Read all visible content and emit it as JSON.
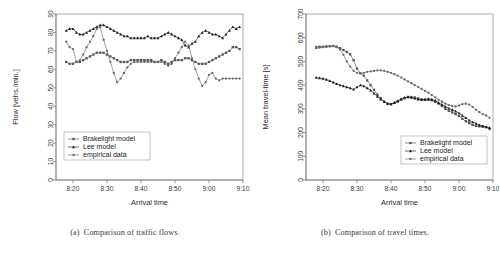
{
  "figure": {
    "panels": [
      {
        "id": "a",
        "caption_id": "(a)",
        "caption_text": "Comparison of traffic flows.",
        "chart_data": {
          "type": "line",
          "title": "",
          "xlabel": "Arrival time",
          "ylabel": "Flow [vehs./min.]",
          "xlim": [
            495,
            550
          ],
          "ylim": [
            0,
            90
          ],
          "yticks": [
            0,
            10,
            20,
            30,
            40,
            50,
            60,
            70,
            80,
            90
          ],
          "xticks": [
            500,
            510,
            520,
            530,
            540,
            550
          ],
          "xticklabels": [
            "8:20",
            "8:30",
            "8:40",
            "8:50",
            "9:00",
            "9:10"
          ],
          "grid": false,
          "legend_position": "lower-left",
          "x": [
            498,
            499,
            500,
            501,
            502,
            503,
            504,
            505,
            506,
            507,
            508,
            509,
            510,
            511,
            512,
            513,
            514,
            515,
            516,
            517,
            518,
            519,
            520,
            521,
            522,
            523,
            524,
            525,
            526,
            527,
            528,
            529,
            530,
            531,
            532,
            533,
            534,
            535,
            536,
            537,
            538,
            539,
            540,
            541,
            542,
            543,
            544,
            545,
            546,
            547,
            548,
            549
          ],
          "series": [
            {
              "name": "Brakelight model",
              "marker": "square",
              "color": "#555555",
              "values": [
                64,
                63,
                63,
                64,
                64,
                65,
                66,
                67,
                68,
                69,
                69,
                69,
                68,
                67,
                66,
                65,
                64,
                64,
                64,
                65,
                65,
                65,
                65,
                65,
                65,
                65,
                64,
                64,
                65,
                64,
                63,
                64,
                65,
                65,
                65,
                66,
                66,
                65,
                64,
                63,
                63,
                63,
                64,
                65,
                66,
                67,
                68,
                69,
                70,
                72,
                72,
                71
              ]
            },
            {
              "name": "Lee model",
              "marker": "triangle",
              "color": "#1a1a1a",
              "values": [
                81,
                82,
                82,
                80,
                79,
                79,
                80,
                81,
                82,
                83,
                84,
                84,
                83,
                82,
                81,
                80,
                79,
                78,
                78,
                77,
                77,
                77,
                77,
                77,
                78,
                77,
                77,
                77,
                78,
                79,
                80,
                79,
                78,
                77,
                76,
                73,
                72,
                74,
                75,
                78,
                80,
                81,
                80,
                79,
                79,
                78,
                77,
                79,
                81,
                83,
                82,
                83
              ]
            },
            {
              "name": "empirical data",
              "marker": "circle",
              "color": "#6a6a6a",
              "values": [
                75,
                72,
                71,
                64,
                65,
                68,
                72,
                75,
                78,
                82,
                83,
                76,
                70,
                64,
                58,
                53,
                55,
                58,
                61,
                63,
                64,
                64,
                64,
                64,
                64,
                64,
                64,
                64,
                64,
                63,
                62,
                63,
                66,
                69,
                72,
                75,
                73,
                66,
                60,
                55,
                51,
                53,
                57,
                58,
                55,
                54,
                55,
                55,
                55,
                55,
                55,
                55
              ]
            }
          ]
        }
      },
      {
        "id": "b",
        "caption_id": "(b)",
        "caption_text": "Comparison of travel times.",
        "chart_data": {
          "type": "line",
          "title": "",
          "xlabel": "Arrival time",
          "ylabel": "Mean travel-time [s]",
          "xlim": [
            495,
            550
          ],
          "ylim": [
            0,
            700
          ],
          "yticks": [
            0,
            100,
            200,
            300,
            400,
            500,
            600,
            700
          ],
          "xticks": [
            500,
            510,
            520,
            530,
            540,
            550
          ],
          "xticklabels": [
            "8:20",
            "8:30",
            "8:40",
            "8:50",
            "9:00",
            "9:10"
          ],
          "grid": false,
          "legend_position": "lower-right",
          "x": [
            498,
            499,
            500,
            501,
            502,
            503,
            504,
            505,
            506,
            507,
            508,
            509,
            510,
            511,
            512,
            513,
            514,
            515,
            516,
            517,
            518,
            519,
            520,
            521,
            522,
            523,
            524,
            525,
            526,
            527,
            528,
            529,
            530,
            531,
            532,
            533,
            534,
            535,
            536,
            537,
            538,
            539,
            540,
            541,
            542,
            543,
            544,
            545,
            546,
            547,
            548,
            549
          ],
          "series": [
            {
              "name": "Brakelight model",
              "marker": "square",
              "color": "#555555",
              "values": [
                560,
                562,
                562,
                563,
                564,
                565,
                562,
                556,
                548,
                540,
                530,
                505,
                470,
                450,
                440,
                420,
                400,
                380,
                360,
                345,
                330,
                322,
                320,
                325,
                330,
                338,
                345,
                350,
                350,
                348,
                344,
                340,
                338,
                338,
                336,
                330,
                322,
                312,
                300,
                292,
                285,
                278,
                270,
                258,
                248,
                240,
                232,
                228,
                226,
                225,
                222,
                215
              ]
            },
            {
              "name": "Lee model",
              "marker": "triangle",
              "color": "#1a1a1a",
              "values": [
                432,
                430,
                428,
                424,
                418,
                412,
                406,
                400,
                396,
                392,
                388,
                382,
                392,
                400,
                396,
                388,
                378,
                366,
                352,
                340,
                330,
                322,
                320,
                326,
                334,
                342,
                348,
                350,
                348,
                344,
                340,
                338,
                340,
                342,
                340,
                335,
                326,
                318,
                310,
                302,
                296,
                290,
                282,
                272,
                262,
                252,
                244,
                238,
                232,
                228,
                224,
                220
              ]
            },
            {
              "name": "empirical data",
              "marker": "circle",
              "color": "#6a6a6a",
              "values": [
                556,
                558,
                560,
                562,
                564,
                565,
                560,
                550,
                528,
                500,
                478,
                460,
                452,
                450,
                452,
                456,
                458,
                460,
                462,
                462,
                460,
                456,
                452,
                446,
                440,
                432,
                424,
                416,
                408,
                400,
                392,
                384,
                376,
                368,
                358,
                348,
                338,
                330,
                322,
                316,
                312,
                310,
                314,
                320,
                322,
                318,
                308,
                296,
                286,
                278,
                272,
                262
              ]
            }
          ]
        }
      }
    ]
  }
}
